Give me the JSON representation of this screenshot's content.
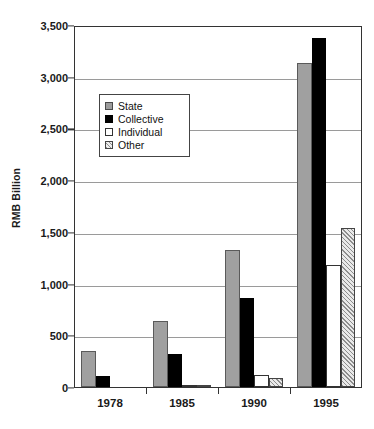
{
  "chart_data": {
    "type": "bar",
    "title": "",
    "subtitle": "",
    "xlabel": "",
    "ylabel": "RMB Billion",
    "categories": [
      "1978",
      "1985",
      "1990",
      "1995"
    ],
    "series": [
      {
        "name": "State",
        "values": [
          350,
          640,
          1320,
          3130
        ],
        "color": "#a0a0a0",
        "pattern": "solid-gray"
      },
      {
        "name": "Collective",
        "values": [
          110,
          320,
          860,
          3370
        ],
        "color": "#000000",
        "pattern": "solid-black"
      },
      {
        "name": "Individual",
        "values": [
          0,
          5,
          120,
          1180
        ],
        "color": "#ffffff",
        "pattern": "empty-white"
      },
      {
        "name": "Other",
        "values": [
          0,
          15,
          90,
          1540
        ],
        "color": "#e9e9e9",
        "pattern": "diagonal-hatch"
      }
    ],
    "ylim": [
      0,
      3500
    ],
    "ytick_values": [
      0,
      500,
      1000,
      1500,
      2000,
      2500,
      3000,
      3500
    ],
    "ytick_labels": [
      "0",
      "500",
      "1,000",
      "1,500",
      "2,000",
      "2,500",
      "3,000",
      "3,500"
    ],
    "grid": true,
    "grid_axis": "y",
    "legend_position": "inside-upper-left",
    "legend_entries": [
      "State",
      "Collective",
      "Individual",
      "Other"
    ]
  },
  "axis": {
    "y_title": "RMB Billion"
  },
  "legend": {
    "items": [
      {
        "label": "State"
      },
      {
        "label": "Collective"
      },
      {
        "label": "Individual"
      },
      {
        "label": "Other"
      }
    ]
  }
}
